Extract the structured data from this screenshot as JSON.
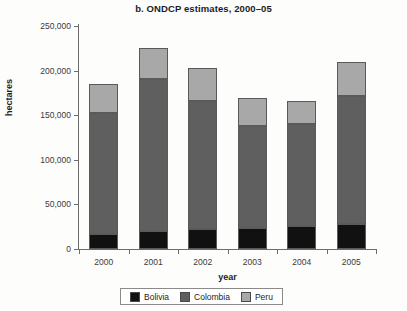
{
  "chart_data": {
    "type": "bar",
    "stacked": true,
    "title": "b. ONDCP estimates, 2000–05",
    "xlabel": "year",
    "ylabel": "hectares",
    "categories": [
      "2000",
      "2001",
      "2002",
      "2003",
      "2004",
      "2005"
    ],
    "ylim": [
      0,
      250000
    ],
    "yticks": [
      0,
      50000,
      100000,
      150000,
      200000,
      250000
    ],
    "ytick_labels": [
      "0",
      "50,000",
      "100,000",
      "150,000",
      "200,000",
      "250,000"
    ],
    "grid": false,
    "legend_position": "bottom",
    "series": [
      {
        "name": "Bolivia",
        "color": "#111111",
        "values": [
          17000,
          20000,
          22000,
          24000,
          25500,
          28000
        ]
      },
      {
        "name": "Colombia",
        "color": "#5f5f5f",
        "values": [
          135000,
          171000,
          144000,
          114000,
          114500,
          144000
        ]
      },
      {
        "name": "Peru",
        "color": "#a8a8a8",
        "values": [
          33000,
          34000,
          37000,
          31000,
          26000,
          38000
        ]
      }
    ],
    "totals": [
      185000,
      225000,
      203000,
      169000,
      166000,
      210000
    ]
  }
}
